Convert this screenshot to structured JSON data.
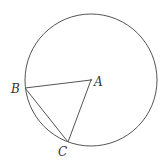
{
  "diagram": {
    "type": "geometry",
    "stroke_color": "#555555",
    "circle": {
      "center": "A",
      "cx": 91,
      "cy": 80,
      "r": 66
    },
    "points": [
      {
        "name": "A",
        "label": "A",
        "x": 91,
        "y": 80,
        "label_x": 94,
        "label_y": 86
      },
      {
        "name": "B",
        "label": "B",
        "x": 25,
        "y": 88,
        "label_x": 11,
        "label_y": 93
      },
      {
        "name": "C",
        "label": "C",
        "x": 68,
        "y": 142,
        "label_x": 58,
        "label_y": 156
      }
    ],
    "segments": [
      {
        "from": "B",
        "to": "A"
      },
      {
        "from": "A",
        "to": "C"
      },
      {
        "from": "B",
        "to": "C"
      }
    ]
  }
}
